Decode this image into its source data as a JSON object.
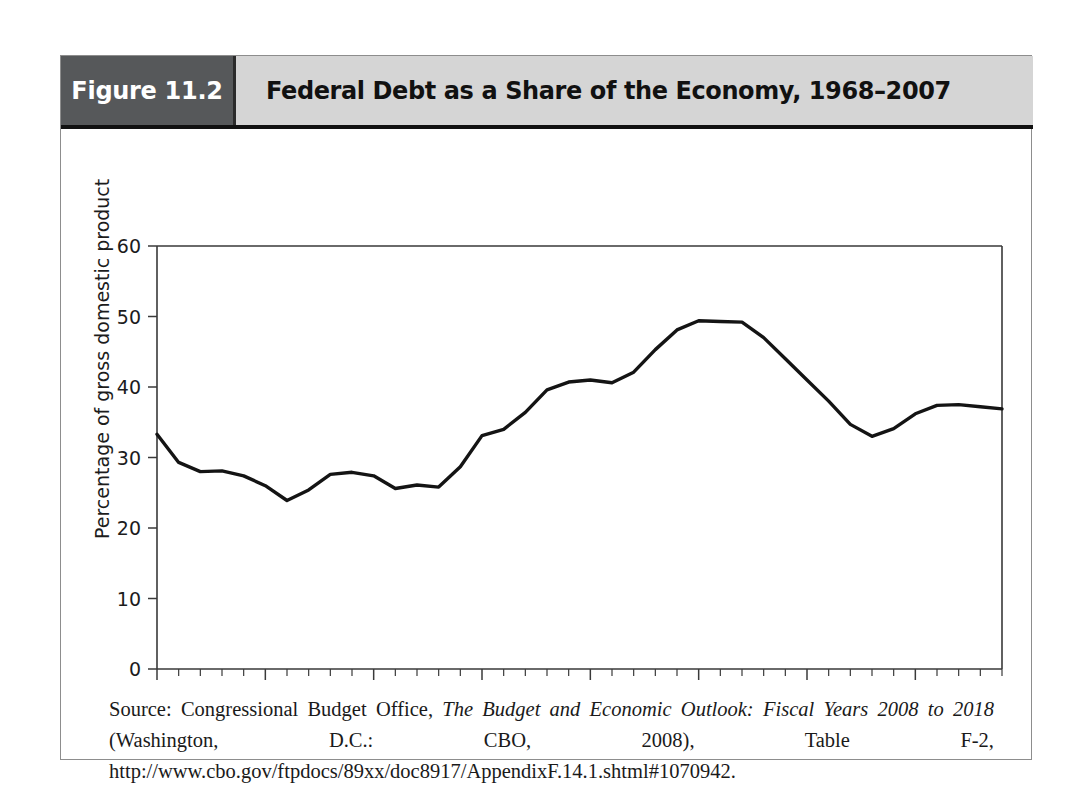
{
  "figure": {
    "number_label": "Figure 11.2",
    "title": "Federal Debt as a Share of the Economy, 1968–2007"
  },
  "source_note": {
    "prefix": "Source: Congressional Budget Office, ",
    "italic_title": "The Budget and Economic Outlook: Fiscal Years 2008 to 2018",
    "suffix": " (Washington, D.C.: CBO, 2008), Table F-2, http://www.cbo.gov/ftpdocs/89xx/doc8917/AppendixF.14.1.shtml#1070942."
  },
  "chart_data": {
    "type": "line",
    "title": "Federal Debt as a Share of the Economy, 1968–2007",
    "xlabel": "",
    "ylabel": "Percentage of gross domestic product",
    "xlim": [
      1968,
      2007
    ],
    "ylim": [
      0,
      60
    ],
    "ytick_labels": [
      "0",
      "10",
      "20",
      "30",
      "40",
      "50",
      "60"
    ],
    "yticks": [
      0,
      10,
      20,
      30,
      40,
      50,
      60
    ],
    "xtick_labels": [
      "1968",
      "1973",
      "1978",
      "1983",
      "1988",
      "1993",
      "1998",
      "2003"
    ],
    "xticks": [
      1968,
      1973,
      1978,
      1983,
      1988,
      1993,
      1998,
      2003
    ],
    "x_minor_tick_interval": 1,
    "grid": false,
    "legend": false,
    "line_color": "#141414",
    "series": [
      {
        "name": "Federal debt held by the public",
        "x": [
          1968,
          1969,
          1970,
          1971,
          1972,
          1973,
          1974,
          1975,
          1976,
          1977,
          1978,
          1979,
          1980,
          1981,
          1982,
          1983,
          1984,
          1985,
          1986,
          1987,
          1988,
          1989,
          1990,
          1991,
          1992,
          1993,
          1994,
          1995,
          1996,
          1997,
          1998,
          1999,
          2000,
          2001,
          2002,
          2003,
          2004,
          2005,
          2006,
          2007
        ],
        "values": [
          33.3,
          29.3,
          28.0,
          28.1,
          27.4,
          26.0,
          23.9,
          25.4,
          27.6,
          27.9,
          27.4,
          25.6,
          26.1,
          25.8,
          28.7,
          33.1,
          34.0,
          36.4,
          39.6,
          40.7,
          41.0,
          40.6,
          42.1,
          45.3,
          48.1,
          49.4,
          49.3,
          49.2,
          47.0,
          44.0,
          41.0,
          38.0,
          34.7,
          33.0,
          34.1,
          36.2,
          37.4,
          37.5,
          37.2,
          36.9
        ]
      }
    ]
  }
}
